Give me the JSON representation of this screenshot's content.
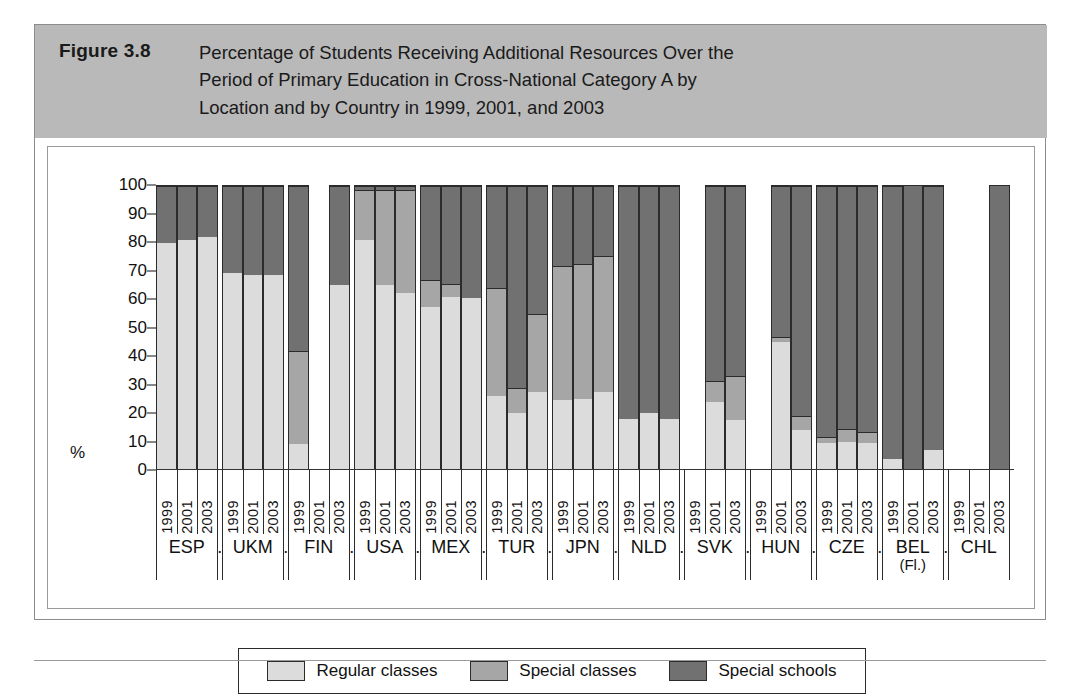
{
  "figure": {
    "number": "Figure 3.8",
    "title": "Percentage of Students Receiving Additional Resources Over the Period of Primary Education in Cross-National Category A by Location and by Country in 1999, 2001, and 2003",
    "title_line1": "Percentage of Students Receiving Additional Resources Over the",
    "title_line2": "Period of Primary Education in Cross-National Category A by",
    "title_line3": "Location and by Country in 1999, 2001, and 2003"
  },
  "axis": {
    "y_label": "%",
    "y_ticks": [
      "100",
      "90",
      "80",
      "70",
      "60",
      "50",
      "40",
      "30",
      "20",
      "10",
      "0"
    ],
    "y_min": 0,
    "y_max": 100,
    "separator": "."
  },
  "legend": {
    "items": [
      {
        "label": "Regular classes",
        "key": "regular",
        "color": "#dcdcdc"
      },
      {
        "label": "Special classes",
        "key": "special-classes",
        "color": "#a6a6a6"
      },
      {
        "label": "Special schools",
        "key": "special-schools",
        "color": "#717171"
      }
    ]
  },
  "chart_data": {
    "type": "bar",
    "subtype": "stacked-percentage",
    "title": "Percentage of Students Receiving Additional Resources Over the Period of Primary Education in Cross-National Category A by Location and by Country in 1999, 2001, and 2003",
    "xlabel": "",
    "ylabel": "%",
    "ylim": [
      0,
      100
    ],
    "grid": false,
    "legend_position": "bottom",
    "categories": [
      "ESP",
      "UKM",
      "FIN",
      "USA",
      "MEX",
      "TUR",
      "JPN",
      "NLD",
      "SVK",
      "HUN",
      "CZE",
      "BEL (Fl.)",
      "CHL"
    ],
    "years": [
      "1999",
      "2001",
      "2003"
    ],
    "series": [
      {
        "name": "Regular classes",
        "key": "regular"
      },
      {
        "name": "Special classes",
        "key": "special_classes"
      },
      {
        "name": "Special schools",
        "key": "special_schools"
      }
    ],
    "groups": [
      {
        "country": "ESP",
        "bars": [
          {
            "year": "1999",
            "present": true,
            "regular": 80.0,
            "special_classes": 0.0,
            "special_schools": 20.0
          },
          {
            "year": "2001",
            "present": true,
            "regular": 81.0,
            "special_classes": 0.0,
            "special_schools": 19.0
          },
          {
            "year": "2003",
            "present": true,
            "regular": 82.0,
            "special_classes": 0.0,
            "special_schools": 18.0
          }
        ]
      },
      {
        "country": "UKM",
        "bars": [
          {
            "year": "1999",
            "present": true,
            "regular": 69.5,
            "special_classes": 0.0,
            "special_schools": 30.5
          },
          {
            "year": "2001",
            "present": true,
            "regular": 68.5,
            "special_classes": 0.0,
            "special_schools": 31.5
          },
          {
            "year": "2003",
            "present": true,
            "regular": 68.5,
            "special_classes": 0.0,
            "special_schools": 31.5
          }
        ]
      },
      {
        "country": "FIN",
        "bars": [
          {
            "year": "1999",
            "present": true,
            "regular": 9.0,
            "special_classes": 33.0,
            "special_schools": 58.0
          },
          {
            "year": "2001",
            "present": false,
            "regular": 0.0,
            "special_classes": 0.0,
            "special_schools": 0.0
          },
          {
            "year": "2003",
            "present": true,
            "regular": 65.0,
            "special_classes": 0.0,
            "special_schools": 35.0
          }
        ]
      },
      {
        "country": "USA",
        "bars": [
          {
            "year": "1999",
            "present": true,
            "regular": 81.0,
            "special_classes": 17.5,
            "special_schools": 1.5
          },
          {
            "year": "2001",
            "present": true,
            "regular": 65.0,
            "special_classes": 33.5,
            "special_schools": 1.5
          },
          {
            "year": "2003",
            "present": true,
            "regular": 62.5,
            "special_classes": 36.0,
            "special_schools": 1.5
          }
        ]
      },
      {
        "country": "MEX",
        "bars": [
          {
            "year": "1999",
            "present": true,
            "regular": 57.5,
            "special_classes": 9.5,
            "special_schools": 33.0
          },
          {
            "year": "2001",
            "present": true,
            "regular": 61.0,
            "special_classes": 4.5,
            "special_schools": 34.5
          },
          {
            "year": "2003",
            "present": true,
            "regular": 60.5,
            "special_classes": 0.0,
            "special_schools": 39.5
          }
        ]
      },
      {
        "country": "TUR",
        "bars": [
          {
            "year": "1999",
            "present": true,
            "regular": 26.0,
            "special_classes": 38.0,
            "special_schools": 36.0
          },
          {
            "year": "2001",
            "present": true,
            "regular": 20.0,
            "special_classes": 9.0,
            "special_schools": 71.0
          },
          {
            "year": "2003",
            "present": true,
            "regular": 27.5,
            "special_classes": 27.5,
            "special_schools": 45.0
          }
        ]
      },
      {
        "country": "JPN",
        "bars": [
          {
            "year": "1999",
            "present": true,
            "regular": 24.5,
            "special_classes": 47.5,
            "special_schools": 28.0
          },
          {
            "year": "2001",
            "present": true,
            "regular": 25.0,
            "special_classes": 47.5,
            "special_schools": 27.5
          },
          {
            "year": "2003",
            "present": true,
            "regular": 27.5,
            "special_classes": 48.0,
            "special_schools": 24.5
          }
        ]
      },
      {
        "country": "NLD",
        "bars": [
          {
            "year": "1999",
            "present": true,
            "regular": 18.0,
            "special_classes": 0.0,
            "special_schools": 82.0
          },
          {
            "year": "2001",
            "present": true,
            "regular": 20.0,
            "special_classes": 0.0,
            "special_schools": 80.0
          },
          {
            "year": "2003",
            "present": true,
            "regular": 18.0,
            "special_classes": 0.0,
            "special_schools": 82.0
          }
        ]
      },
      {
        "country": "SVK",
        "bars": [
          {
            "year": "1999",
            "present": false,
            "regular": 0.0,
            "special_classes": 0.0,
            "special_schools": 0.0
          },
          {
            "year": "2001",
            "present": true,
            "regular": 24.0,
            "special_classes": 7.5,
            "special_schools": 68.5
          },
          {
            "year": "2003",
            "present": true,
            "regular": 17.5,
            "special_classes": 15.5,
            "special_schools": 67.0
          }
        ]
      },
      {
        "country": "HUN",
        "bars": [
          {
            "year": "1999",
            "present": false,
            "regular": 0.0,
            "special_classes": 0.0,
            "special_schools": 0.0
          },
          {
            "year": "2001",
            "present": true,
            "regular": 45.0,
            "special_classes": 2.0,
            "special_schools": 53.0
          },
          {
            "year": "2003",
            "present": true,
            "regular": 14.0,
            "special_classes": 5.0,
            "special_schools": 81.0
          }
        ]
      },
      {
        "country": "CZE",
        "bars": [
          {
            "year": "1999",
            "present": true,
            "regular": 9.5,
            "special_classes": 2.0,
            "special_schools": 88.5
          },
          {
            "year": "2001",
            "present": true,
            "regular": 10.0,
            "special_classes": 4.5,
            "special_schools": 85.5
          },
          {
            "year": "2003",
            "present": true,
            "regular": 9.5,
            "special_classes": 4.0,
            "special_schools": 86.5
          }
        ]
      },
      {
        "country": "BEL (Fl.)",
        "bars": [
          {
            "year": "1999",
            "present": true,
            "regular": 4.0,
            "special_classes": 0.0,
            "special_schools": 96.0
          },
          {
            "year": "2001",
            "present": true,
            "regular": 0.0,
            "special_classes": 0.0,
            "special_schools": 100.0
          },
          {
            "year": "2003",
            "present": true,
            "regular": 7.0,
            "special_classes": 0.0,
            "special_schools": 93.0
          }
        ]
      },
      {
        "country": "CHL",
        "bars": [
          {
            "year": "1999",
            "present": false,
            "regular": 0.0,
            "special_classes": 0.0,
            "special_schools": 0.0
          },
          {
            "year": "2001",
            "present": false,
            "regular": 0.0,
            "special_classes": 0.0,
            "special_schools": 0.0
          },
          {
            "year": "2003",
            "present": true,
            "regular": 0.0,
            "special_classes": 0.0,
            "special_schools": 100.0
          }
        ]
      }
    ]
  }
}
